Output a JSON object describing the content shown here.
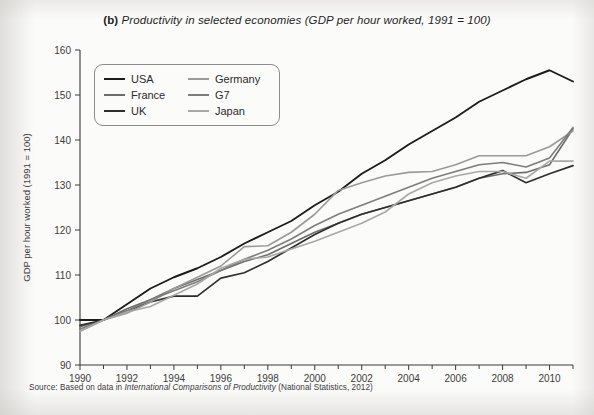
{
  "figure": {
    "label": "(b)",
    "title": "Productivity in selected economies (GDP per hour worked, 1991 = 100)",
    "source_prefix": "Source: Based on data in",
    "source_italic": "International Comparisons of Productivity",
    "source_suffix": "(National Statistics, 2012)"
  },
  "legend": {
    "items": [
      {
        "label": "USA",
        "color": "#1c1c1c"
      },
      {
        "label": "France",
        "color": "#6d6d6d"
      },
      {
        "label": "UK",
        "color": "#2e2e2e"
      },
      {
        "label": "Germany",
        "color": "#9a9a9a"
      },
      {
        "label": "G7",
        "color": "#7d7d7d"
      },
      {
        "label": "Japan",
        "color": "#a8a8a8"
      }
    ]
  },
  "chart_data": {
    "type": "line",
    "title": "(b) Productivity in selected economies (GDP per hour worked, 1991 = 100)",
    "xlabel": "",
    "ylabel": "GDP per hour worked (1991 = 100)",
    "xlim": [
      1990,
      2011
    ],
    "ylim": [
      90,
      160
    ],
    "ytick_step": 10,
    "yticks": [
      90,
      100,
      110,
      120,
      130,
      140,
      150,
      160
    ],
    "xticks": [
      1990,
      1992,
      1994,
      1996,
      1998,
      2000,
      2002,
      2004,
      2006,
      2008,
      2010
    ],
    "xticks_minor": [
      1991,
      1993,
      1995,
      1997,
      1999,
      2001,
      2003,
      2005,
      2007,
      2009,
      2011
    ],
    "grid": false,
    "legend_position": "upper-left-inside",
    "x": [
      1990,
      1991,
      1992,
      1993,
      1994,
      1995,
      1996,
      1997,
      1998,
      1999,
      2000,
      2001,
      2002,
      2003,
      2004,
      2005,
      2006,
      2007,
      2008,
      2009,
      2010,
      2011
    ],
    "series": [
      {
        "name": "USA",
        "color": "#1c1c1c",
        "width": 1.9,
        "values": [
          100.0,
          100.0,
          103.5,
          107.0,
          109.5,
          111.5,
          114.0,
          117.0,
          119.5,
          122.0,
          125.5,
          128.5,
          132.5,
          135.5,
          139.0,
          142.0,
          145.0,
          148.5,
          151.0,
          153.5,
          155.5,
          153.0
        ]
      },
      {
        "name": "USA-upper",
        "color": "#1c1c1c",
        "width": 1.9,
        "values": [
          null,
          null,
          null,
          null,
          null,
          null,
          null,
          null,
          null,
          null,
          null,
          null,
          null,
          null,
          null,
          null,
          null,
          null,
          null,
          null,
          null,
          null
        ]
      },
      {
        "name": "France",
        "color": "#6d6d6d",
        "width": 1.6,
        "values": [
          98.5,
          100.0,
          102.5,
          104.5,
          107.0,
          109.0,
          111.0,
          113.0,
          114.5,
          117.0,
          119.5,
          121.5,
          123.5,
          125.0,
          126.5,
          128.0,
          129.5,
          131.5,
          132.5,
          132.8,
          134.5,
          142.5
        ]
      },
      {
        "name": "UK",
        "color": "#2e2e2e",
        "width": 1.7,
        "values": [
          98.8,
          100.0,
          102.0,
          104.0,
          105.3,
          105.3,
          109.3,
          110.5,
          113.0,
          116.0,
          119.0,
          121.5,
          123.5,
          125.0,
          126.5,
          128.0,
          129.5,
          131.5,
          133.2,
          130.5,
          132.5,
          134.3
        ]
      },
      {
        "name": "Germany",
        "color": "#9a9a9a",
        "width": 1.6,
        "values": [
          97.5,
          100.0,
          101.5,
          104.0,
          107.0,
          109.5,
          112.0,
          116.3,
          116.5,
          119.5,
          123.5,
          128.8,
          130.5,
          132.0,
          132.8,
          133.0,
          134.5,
          136.5,
          136.5,
          136.5,
          138.5,
          142.0
        ]
      },
      {
        "name": "G7",
        "color": "#7d7d7d",
        "width": 1.6,
        "values": [
          98.0,
          100.0,
          102.0,
          104.5,
          106.5,
          108.5,
          111.0,
          113.5,
          115.5,
          118.0,
          121.0,
          123.5,
          125.5,
          127.5,
          129.5,
          131.5,
          133.0,
          134.5,
          135.0,
          134.0,
          136.0,
          142.8
        ]
      },
      {
        "name": "Japan",
        "color": "#a8a8a8",
        "width": 1.6,
        "values": [
          97.5,
          100.0,
          101.8,
          103.0,
          105.5,
          108.0,
          111.5,
          113.5,
          114.0,
          115.8,
          117.5,
          119.5,
          121.5,
          124.0,
          128.0,
          130.5,
          132.0,
          133.0,
          133.0,
          131.5,
          135.3,
          135.3
        ]
      }
    ],
    "series_count": 6,
    "annotations": [
      "All series are indexed so that 1991 = 100",
      "USA peaks near 156 in 2007 before a 2008-2009 dip",
      "Japan and Germany show a sharp 2009 trough and 2010-2011 recovery"
    ]
  }
}
